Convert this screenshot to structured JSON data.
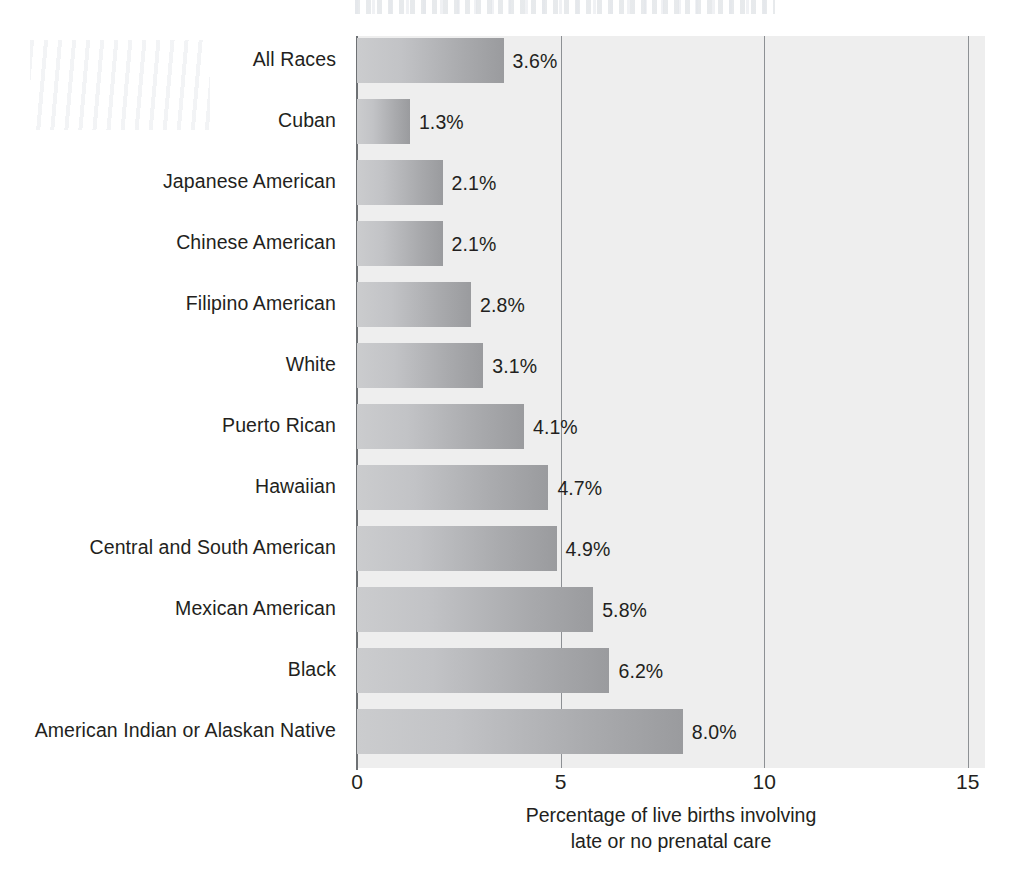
{
  "chart_data": {
    "type": "bar",
    "orientation": "horizontal",
    "title": "",
    "xlabel": "Percentage of live births involving late or no prenatal care",
    "xlabel_lines": [
      "Percentage of live births involving",
      "late or no prenatal care"
    ],
    "ylabel": "",
    "xlim": [
      0,
      15.8
    ],
    "x_ticks": [
      0,
      5,
      10,
      15
    ],
    "x_tick_labels": [
      "0",
      "5",
      "10",
      "15"
    ],
    "grid": "vertical",
    "gridlines_at": [
      5,
      10,
      15
    ],
    "legend": "none",
    "categories": [
      "All Races",
      "Cuban",
      "Japanese American",
      "Chinese American",
      "Filipino American",
      "White",
      "Puerto Rican",
      "Hawaiian",
      "Central and South American",
      "Mexican American",
      "Black",
      "American Indian or Alaskan Native"
    ],
    "values": [
      3.6,
      1.3,
      2.1,
      2.1,
      2.8,
      3.1,
      4.1,
      4.7,
      4.9,
      5.8,
      6.2,
      8.0
    ],
    "value_labels": [
      "3.6%",
      "1.3%",
      "2.1%",
      "2.1%",
      "2.8%",
      "3.1%",
      "4.1%",
      "4.7%",
      "4.9%",
      "5.8%",
      "6.2%",
      "8.0%"
    ],
    "colors": {
      "bar_gradient_start": "#cbccce",
      "bar_gradient_end": "#9a9b9e",
      "plot_background": "#eeeeee",
      "page_background": "#ffffff",
      "gridline": "#8d9094",
      "axis_line": "#6e7174",
      "text": "#231f20"
    }
  }
}
